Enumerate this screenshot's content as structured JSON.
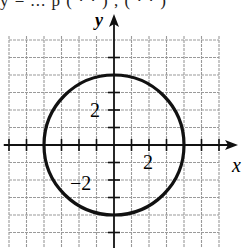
{
  "top_text_partial": "y = ... p ( · · ) , ( · · )",
  "graph": {
    "x_axis_label": "x",
    "y_axis_label": "y",
    "tick_labels": {
      "y_pos": "2",
      "y_neg": "−2",
      "x_pos": "2"
    },
    "unit_px": 17.5,
    "origin_px": [
      114,
      145
    ],
    "x_range": [
      -6,
      6
    ],
    "y_range": [
      -6,
      6
    ],
    "circle": {
      "center": [
        0,
        0
      ],
      "radius": 4
    },
    "colors": {
      "grid": "#9a9a9a",
      "axis": "#111111",
      "curve": "#111111",
      "background": "#ffffff"
    }
  },
  "chart_data": {
    "type": "line",
    "title": "",
    "xlabel": "x",
    "ylabel": "y",
    "series": [
      {
        "name": "circle",
        "center": [
          0,
          0
        ],
        "radius": 4
      }
    ],
    "xlim": [
      -6,
      6
    ],
    "ylim": [
      -6,
      6
    ],
    "tick_labels": {
      "x": [
        "2"
      ],
      "y": [
        "2",
        "−2"
      ]
    },
    "grid": true
  }
}
